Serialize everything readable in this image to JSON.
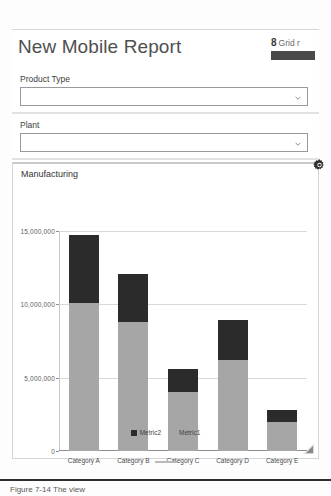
{
  "header": {
    "title": "New Mobile Report",
    "grid_count": "8",
    "grid_label": "Grid r",
    "swatch_color": "#4a4a4a"
  },
  "filters": [
    {
      "name": "product-type",
      "label": "Product Type",
      "value": "",
      "placeholder": "",
      "chevron_icon": "chevron-down-icon"
    },
    {
      "name": "plant",
      "label": "Plant",
      "value": "",
      "placeholder": "",
      "chevron_icon": "chevron-down-icon"
    }
  ],
  "settings": {
    "gear_icon": "gear-icon"
  },
  "chart_panel": {
    "title": "Manufacturing",
    "resize_icon": "resize-handle-icon"
  },
  "footer": {
    "text": "Figure 7-14 The view"
  },
  "chart_data": {
    "type": "bar",
    "stacked": true,
    "title": "Manufacturing",
    "xlabel": "",
    "ylabel": "",
    "grid": true,
    "legend_position": "bottom",
    "ylim": [
      0,
      15000000
    ],
    "yticks": [
      0,
      5000000,
      10000000,
      15000000
    ],
    "ytick_labels": [
      "0",
      "5,000,000",
      "10,000,000",
      "15,000,000"
    ],
    "categories": [
      "Category A",
      "Category B",
      "Category C",
      "Category D",
      "Category E"
    ],
    "series": [
      {
        "name": "Metric1",
        "color": "#a6a6a6",
        "values": [
          10100000,
          8800000,
          4000000,
          6200000,
          2000000
        ]
      },
      {
        "name": "Metric2",
        "color": "#2b2b2b",
        "values": [
          4600000,
          3300000,
          1600000,
          2700000,
          800000
        ]
      }
    ],
    "totals": [
      14700000,
      12100000,
      5600000,
      8900000,
      2800000
    ],
    "legend": [
      {
        "name": "Metric2",
        "color": "#2b2b2b"
      },
      {
        "name": "Metric1",
        "color": "#a6a6a6"
      }
    ]
  }
}
